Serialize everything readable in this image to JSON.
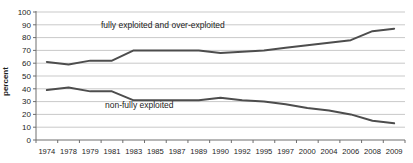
{
  "chart_data": {
    "type": "line",
    "title": "",
    "xlabel": "",
    "ylabel": "percent",
    "ylim": [
      0,
      100
    ],
    "ytick_step": 10,
    "grid": "horizontal",
    "legend_position": "none (inline annotations)",
    "categories": [
      "1974",
      "1978",
      "1979",
      "1981",
      "1983",
      "1985",
      "1987",
      "1989",
      "1990",
      "1992",
      "1995",
      "1997",
      "2000",
      "2004",
      "2006",
      "2008",
      "2009"
    ],
    "series": [
      {
        "name": "fully exploited and over-exploited",
        "values": [
          61,
          59,
          62,
          62,
          70,
          70,
          70,
          70,
          68,
          69,
          70,
          72,
          74,
          76,
          78,
          85,
          87
        ],
        "annotation": {
          "text": "fully exploited and over-exploited",
          "x": 101,
          "y": 28
        }
      },
      {
        "name": "non-fully exploited",
        "values": [
          39,
          41,
          38,
          38,
          31,
          31,
          31,
          31,
          33,
          31,
          30,
          28,
          25,
          23,
          20,
          15,
          13
        ],
        "annotation": {
          "text": "non-fully exploited",
          "x": 105,
          "y": 108
        }
      }
    ],
    "colors": {
      "series_line": "#4d4d4d",
      "gridline": "#c9c9c9",
      "axis": "#6e6e6e",
      "text": "#1c1c1c",
      "background": "#ffffff"
    }
  }
}
